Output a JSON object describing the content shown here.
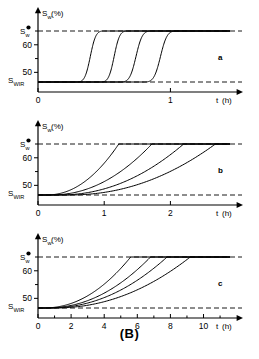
{
  "figure": {
    "caption": "(B)",
    "footer_text": "",
    "axis": {
      "y_label_main": "S",
      "y_label_sub": "w",
      "y_label_unit": "(%)",
      "x_label_main": "t",
      "x_label_unit": "(h)",
      "y_top_label_main": "S",
      "y_top_label_sub": "w",
      "y_top_label_star": "*",
      "y_bottom_label_main": "S",
      "y_bottom_label_sub": "WIR"
    }
  },
  "chart_data": [
    {
      "type": "line",
      "panel": "a",
      "title": "",
      "xlabel": "t (h)",
      "ylabel": "Sw (%)",
      "xlim": [
        0,
        1.45
      ],
      "ylim": [
        44.5,
        66.5
      ],
      "grid": false,
      "legend": "none",
      "yticks": [
        50,
        60
      ],
      "yticklabels": [
        "50",
        "60"
      ],
      "y_minor_ticks": [
        55,
        65
      ],
      "xticks": [
        0,
        1
      ],
      "xticklabels": [
        "0",
        "1"
      ],
      "x_minor_ticks": [],
      "reference_lines": [
        {
          "name": "Sw-star",
          "value": 65,
          "style": "dashed",
          "label": "S w *"
        },
        {
          "name": "Swir",
          "value": 46.5,
          "style": "dashed",
          "label": "S WIR"
        }
      ],
      "series": [
        {
          "name": "curve-1",
          "shape": "sigmoid",
          "t_break": 0.29,
          "t_plateau": 0.5
        },
        {
          "name": "curve-2",
          "shape": "sigmoid",
          "t_break": 0.47,
          "t_plateau": 0.68
        },
        {
          "name": "curve-3",
          "shape": "sigmoid",
          "t_break": 0.62,
          "t_plateau": 0.86
        },
        {
          "name": "curve-4",
          "shape": "sigmoid",
          "t_break": 0.8,
          "t_plateau": 1.05
        }
      ]
    },
    {
      "type": "line",
      "panel": "b",
      "title": "",
      "xlabel": "t (h)",
      "ylabel": "Sw (%)",
      "xlim": [
        0,
        2.9
      ],
      "ylim": [
        44.5,
        66.5
      ],
      "grid": false,
      "legend": "none",
      "yticks": [
        50,
        60
      ],
      "yticklabels": [
        "50",
        "60"
      ],
      "y_minor_ticks": [
        55,
        65
      ],
      "xticks": [
        0,
        1,
        2
      ],
      "xticklabels": [
        "0",
        "1",
        "2"
      ],
      "x_minor_ticks": [],
      "reference_lines": [
        {
          "name": "Sw-star",
          "value": 65,
          "style": "dashed",
          "label": "S w *"
        },
        {
          "name": "Swir",
          "value": 46.5,
          "style": "dashed",
          "label": "S WIR"
        }
      ],
      "series": [
        {
          "name": "curve-1",
          "shape": "convex",
          "t_break": 0.12,
          "t_plateau": 1.22
        },
        {
          "name": "curve-2",
          "shape": "convex",
          "t_break": 0.18,
          "t_plateau": 1.72
        },
        {
          "name": "curve-3",
          "shape": "convex",
          "t_break": 0.3,
          "t_plateau": 2.2
        },
        {
          "name": "curve-4",
          "shape": "convex",
          "t_break": 0.45,
          "t_plateau": 2.68
        }
      ]
    },
    {
      "type": "line",
      "panel": "c",
      "title": "",
      "xlabel": "t (h)",
      "ylabel": "Sw (%)",
      "xlim": [
        0,
        11.6
      ],
      "ylim": [
        44.5,
        66.5
      ],
      "grid": false,
      "legend": "none",
      "yticks": [
        50,
        60
      ],
      "yticklabels": [
        "50",
        "60"
      ],
      "y_minor_ticks": [
        55,
        65
      ],
      "xticks": [
        0,
        2,
        4,
        6,
        8,
        10
      ],
      "xticklabels": [
        "0",
        "2",
        "4",
        "6",
        "8",
        "10"
      ],
      "x_minor_ticks": [
        1,
        3,
        5,
        7,
        9,
        11
      ],
      "reference_lines": [
        {
          "name": "Sw-star",
          "value": 65,
          "style": "dashed",
          "label": "S w *"
        },
        {
          "name": "Swir",
          "value": 46.5,
          "style": "dashed",
          "label": "S WIR"
        }
      ],
      "series": [
        {
          "name": "curve-1",
          "shape": "convex",
          "t_break": 0.3,
          "t_plateau": 5.6
        },
        {
          "name": "curve-2",
          "shape": "convex",
          "t_break": 0.45,
          "t_plateau": 6.8
        },
        {
          "name": "curve-3",
          "shape": "convex",
          "t_break": 0.6,
          "t_plateau": 7.8
        },
        {
          "name": "curve-4",
          "shape": "convex",
          "t_break": 0.9,
          "t_plateau": 9.2
        }
      ]
    }
  ],
  "panel_letters": {
    "a": "a",
    "b": "b",
    "c": "c"
  }
}
